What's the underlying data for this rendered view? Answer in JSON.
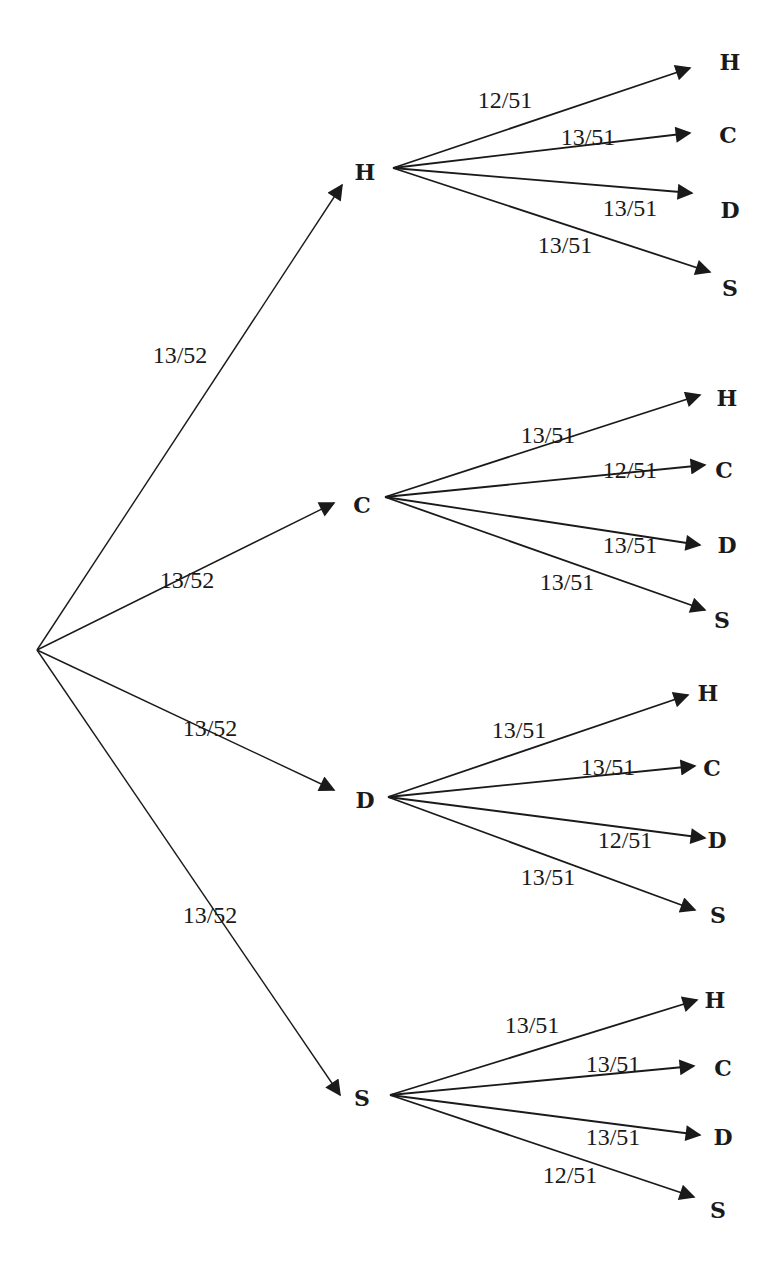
{
  "diagram": {
    "type": "probability-tree",
    "root": {
      "x": 37,
      "y": 650
    },
    "level1": [
      {
        "suit": "H",
        "prob": "13/52",
        "node": {
          "x": 365,
          "y": 172
        },
        "source": {
          "x": 393,
          "y": 168
        },
        "tip": {
          "x": 342,
          "y": 185
        },
        "prob_pos": {
          "x": 180,
          "y": 355
        },
        "children": [
          {
            "suit": "H",
            "prob": "12/51",
            "tip": {
              "x": 690,
              "y": 68
            },
            "label_pos": {
              "x": 730,
              "y": 62
            },
            "prob_pos": {
              "x": 505,
              "y": 100
            }
          },
          {
            "suit": "C",
            "prob": "13/51",
            "tip": {
              "x": 690,
              "y": 133
            },
            "label_pos": {
              "x": 728,
              "y": 135
            },
            "prob_pos": {
              "x": 588,
              "y": 137
            }
          },
          {
            "suit": "D",
            "prob": "13/51",
            "tip": {
              "x": 692,
              "y": 193
            },
            "label_pos": {
              "x": 730,
              "y": 210
            },
            "prob_pos": {
              "x": 630,
              "y": 208
            }
          },
          {
            "suit": "S",
            "prob": "13/51",
            "tip": {
              "x": 710,
              "y": 272
            },
            "label_pos": {
              "x": 730,
              "y": 288
            },
            "prob_pos": {
              "x": 565,
              "y": 245
            }
          }
        ]
      },
      {
        "suit": "C",
        "prob": "13/52",
        "node": {
          "x": 362,
          "y": 505
        },
        "source": {
          "x": 385,
          "y": 497
        },
        "tip": {
          "x": 334,
          "y": 503
        },
        "prob_pos": {
          "x": 187,
          "y": 580
        },
        "children": [
          {
            "suit": "H",
            "prob": "13/51",
            "tip": {
              "x": 700,
              "y": 395
            },
            "label_pos": {
              "x": 727,
              "y": 398
            },
            "prob_pos": {
              "x": 548,
              "y": 435
            }
          },
          {
            "suit": "C",
            "prob": "12/51",
            "tip": {
              "x": 705,
              "y": 465
            },
            "label_pos": {
              "x": 724,
              "y": 470
            },
            "prob_pos": {
              "x": 630,
              "y": 470
            }
          },
          {
            "suit": "D",
            "prob": "13/51",
            "tip": {
              "x": 700,
              "y": 545
            },
            "label_pos": {
              "x": 727,
              "y": 545
            },
            "prob_pos": {
              "x": 630,
              "y": 545
            }
          },
          {
            "suit": "S",
            "prob": "13/51",
            "tip": {
              "x": 705,
              "y": 610
            },
            "label_pos": {
              "x": 722,
              "y": 620
            },
            "prob_pos": {
              "x": 567,
              "y": 582
            }
          }
        ]
      },
      {
        "suit": "D",
        "prob": "13/52",
        "node": {
          "x": 365,
          "y": 800
        },
        "source": {
          "x": 388,
          "y": 797
        },
        "tip": {
          "x": 334,
          "y": 790
        },
        "prob_pos": {
          "x": 210,
          "y": 728
        },
        "children": [
          {
            "suit": "H",
            "prob": "13/51",
            "tip": {
              "x": 688,
              "y": 695
            },
            "label_pos": {
              "x": 708,
              "y": 693
            },
            "prob_pos": {
              "x": 519,
              "y": 730
            }
          },
          {
            "suit": "C",
            "prob": "13/51",
            "tip": {
              "x": 695,
              "y": 766
            },
            "label_pos": {
              "x": 712,
              "y": 768
            },
            "prob_pos": {
              "x": 608,
              "y": 767
            }
          },
          {
            "suit": "D",
            "prob": "12/51",
            "tip": {
              "x": 705,
              "y": 838
            },
            "label_pos": {
              "x": 717,
              "y": 840
            },
            "prob_pos": {
              "x": 625,
              "y": 840
            }
          },
          {
            "suit": "S",
            "prob": "13/51",
            "tip": {
              "x": 695,
              "y": 910
            },
            "label_pos": {
              "x": 718,
              "y": 915
            },
            "prob_pos": {
              "x": 548,
              "y": 877
            }
          }
        ]
      },
      {
        "suit": "S",
        "prob": "13/52",
        "node": {
          "x": 362,
          "y": 1098
        },
        "source": {
          "x": 390,
          "y": 1095
        },
        "tip": {
          "x": 340,
          "y": 1095
        },
        "prob_pos": {
          "x": 210,
          "y": 915
        },
        "children": [
          {
            "suit": "H",
            "prob": "13/51",
            "tip": {
              "x": 697,
              "y": 1000
            },
            "label_pos": {
              "x": 715,
              "y": 1000
            },
            "prob_pos": {
              "x": 532,
              "y": 1025
            }
          },
          {
            "suit": "C",
            "prob": "13/51",
            "tip": {
              "x": 694,
              "y": 1066
            },
            "label_pos": {
              "x": 723,
              "y": 1068
            },
            "prob_pos": {
              "x": 613,
              "y": 1064
            }
          },
          {
            "suit": "D",
            "prob": "13/51",
            "tip": {
              "x": 700,
              "y": 1135
            },
            "label_pos": {
              "x": 723,
              "y": 1137
            },
            "prob_pos": {
              "x": 613,
              "y": 1137
            }
          },
          {
            "suit": "S",
            "prob": "12/51",
            "tip": {
              "x": 694,
              "y": 1197
            },
            "label_pos": {
              "x": 718,
              "y": 1210
            },
            "prob_pos": {
              "x": 570,
              "y": 1175
            }
          }
        ]
      }
    ],
    "colors": {
      "ink": "#1a1a1a",
      "background": "#ffffff"
    }
  }
}
